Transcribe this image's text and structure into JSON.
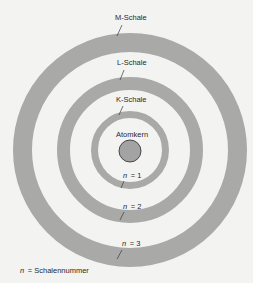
{
  "diagram": {
    "colors": {
      "background": "#f3f3f2",
      "shell": "#a9a9a8",
      "nucleus_fill": "#a3a3a3",
      "nucleus_stroke": "#3a3a3a",
      "text": "#2a2a2a",
      "pointer": "#3a3a3a"
    },
    "center": {
      "x": 130,
      "y": 150
    },
    "nucleus": {
      "label": "Atomkern",
      "radius": 11
    },
    "shells": [
      {
        "name": "K-Schale",
        "n_label": "n = 1",
        "n_var": "n",
        "n_value": "= 1",
        "outer_r": 39,
        "inner_r": 32
      },
      {
        "name": "L-Schale",
        "n_label": "n = 2",
        "n_var": "n",
        "n_value": "= 2",
        "outer_r": 73,
        "inner_r": 60
      },
      {
        "name": "M-Schale",
        "n_label": "n = 3",
        "n_var": "n",
        "n_value": "= 3",
        "outer_r": 117,
        "inner_r": 98
      }
    ],
    "legend": {
      "var": "n",
      "text": "= Schalennummer"
    }
  }
}
